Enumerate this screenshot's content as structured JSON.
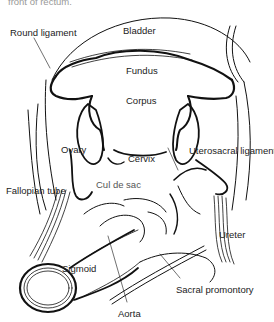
{
  "caption_fragment": "front of rectum.",
  "colors": {
    "ink": "#111111",
    "label": "#222222",
    "background": "#ffffff"
  },
  "labels": {
    "bladder": "Bladder",
    "round_ligament": "Round ligament",
    "fundus": "Fundus",
    "corpus": "Corpus",
    "ovary": "Ovary",
    "cervix": "Cervix",
    "uterosacral_ligament": "Uterosacral ligament",
    "cul_de_sac": "Cul de sac",
    "fallopian_tube": "Fallopian tube",
    "ureter": "Ureter",
    "sigmoid": "Sigmoid",
    "sacral_promontory": "Sacral promontory",
    "aorta": "Aorta"
  }
}
